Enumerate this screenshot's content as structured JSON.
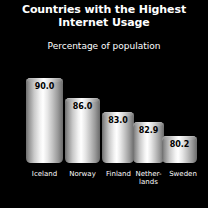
{
  "chart_data": {
    "type": "bar",
    "title": "Countries with the Highest Internet Usage",
    "subtitle": "Percentage of population",
    "xlabel": "",
    "ylabel": "",
    "ylim": [
      0,
      100
    ],
    "grid": false,
    "legend": false,
    "categories": [
      "Iceland",
      "Norway",
      "Finland",
      "Nether-\nlands",
      "Sweden"
    ],
    "values": [
      90.0,
      86.0,
      83.0,
      82.9,
      80.2
    ],
    "value_labels": [
      "90.0",
      "86.0",
      "83.0",
      "82.9",
      "80.2"
    ],
    "bar_style": "cylinder-gradient-grayscale",
    "background_color": "#000000",
    "text_color": "#ffffff",
    "value_label_color": "#000000"
  },
  "bars": [
    {
      "label": "Iceland",
      "value_label": "90.0",
      "value": 90.0,
      "left": 26,
      "width": 37,
      "height": 85
    },
    {
      "label": "Norway",
      "value_label": "86.0",
      "value": 86.0,
      "left": 65,
      "width": 35,
      "height": 65
    },
    {
      "label": "Finland",
      "value_label": "83.0",
      "value": 83.0,
      "left": 102,
      "width": 32,
      "height": 51
    },
    {
      "label": "Nether-\nlands",
      "value_label": "82.9",
      "value": 82.9,
      "left": 133,
      "width": 31,
      "height": 41
    },
    {
      "label": "Sweden",
      "value_label": "80.2",
      "value": 80.2,
      "left": 162,
      "width": 35,
      "height": 27
    }
  ],
  "labels": [
    {
      "text": "Iceland",
      "left": 22,
      "width": 45
    },
    {
      "text": "Norway",
      "left": 60,
      "width": 45
    },
    {
      "text": "Finland",
      "left": 97,
      "width": 43
    },
    {
      "text": "Nether-\nlands",
      "left": 127,
      "width": 43
    },
    {
      "text": "Sweden",
      "left": 163,
      "width": 40
    }
  ]
}
